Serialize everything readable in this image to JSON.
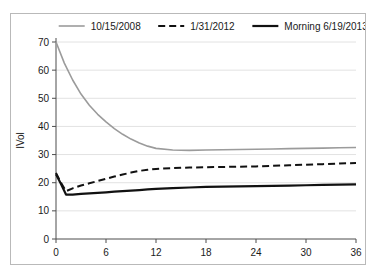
{
  "chart_data": {
    "type": "line",
    "title": "",
    "xlabel": "Time in Months",
    "ylabel": "IVol",
    "xlim": [
      0,
      36
    ],
    "ylim": [
      0,
      70
    ],
    "xticks": [
      0,
      6,
      12,
      18,
      24,
      30,
      36
    ],
    "yticks": [
      0,
      10,
      20,
      30,
      40,
      50,
      60,
      70
    ],
    "grid": "horizontal",
    "legend_position": "top",
    "series": [
      {
        "name": "10/15/2008",
        "color": "#9b9b9b",
        "style": "solid",
        "width": 1.6,
        "x": [
          0,
          1,
          2,
          3,
          4,
          5,
          6,
          7,
          8,
          9,
          10,
          11,
          12,
          14,
          16,
          18,
          20,
          22,
          24,
          26,
          28,
          30,
          32,
          34,
          36
        ],
        "values": [
          70.0,
          62.5,
          56.5,
          51.5,
          47.5,
          44.3,
          41.6,
          39.2,
          37.2,
          35.5,
          34.1,
          33.0,
          32.2,
          31.6,
          31.5,
          31.6,
          31.7,
          31.8,
          31.9,
          32.0,
          32.1,
          32.2,
          32.3,
          32.4,
          32.5
        ]
      },
      {
        "name": "1/31/2012",
        "color": "#111111",
        "style": "dashed",
        "width": 2.0,
        "x": [
          0,
          0.6,
          1.2,
          2,
          3,
          4,
          5,
          6,
          7,
          8,
          9,
          10,
          11,
          12,
          14,
          16,
          18,
          20,
          22,
          24,
          26,
          28,
          30,
          32,
          34,
          36
        ],
        "values": [
          23.5,
          20.0,
          17.0,
          18.0,
          19.0,
          19.8,
          20.6,
          21.4,
          22.2,
          22.9,
          23.6,
          24.2,
          24.6,
          24.9,
          25.2,
          25.4,
          25.5,
          25.6,
          25.7,
          25.8,
          26.0,
          26.2,
          26.4,
          26.6,
          26.8,
          27.0
        ]
      },
      {
        "name": "Morning 6/19/2013",
        "color": "#111111",
        "style": "solid",
        "width": 2.2,
        "x": [
          0,
          0.6,
          1.2,
          2,
          3,
          4,
          5,
          6,
          7,
          8,
          9,
          10,
          11,
          12,
          14,
          16,
          18,
          20,
          22,
          24,
          26,
          28,
          30,
          32,
          34,
          36
        ],
        "values": [
          23.0,
          19.5,
          15.8,
          15.8,
          16.0,
          16.2,
          16.4,
          16.6,
          16.8,
          17.0,
          17.2,
          17.4,
          17.6,
          17.8,
          18.1,
          18.3,
          18.5,
          18.6,
          18.7,
          18.8,
          18.9,
          19.0,
          19.1,
          19.2,
          19.3,
          19.4
        ]
      }
    ]
  },
  "legend": {
    "items": [
      {
        "label": "10/15/2008"
      },
      {
        "label": "1/31/2012"
      },
      {
        "label": "Morning 6/19/2013"
      }
    ]
  },
  "axes": {
    "x_title": "Time in Months",
    "y_title": "IVol"
  }
}
